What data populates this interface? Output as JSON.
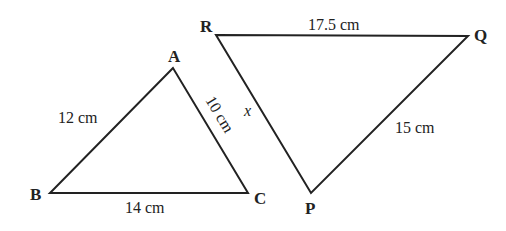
{
  "triangles": [
    {
      "name": "ABC",
      "vertices": {
        "A": "A",
        "B": "B",
        "C": "C"
      },
      "sides": {
        "AB": "12 cm",
        "BC": "14 cm",
        "AC": "10 cm"
      }
    },
    {
      "name": "PQR",
      "vertices": {
        "P": "P",
        "Q": "Q",
        "R": "R"
      },
      "sides": {
        "RQ": "17.5 cm",
        "PQ": "15 cm",
        "RP": "x"
      }
    }
  ]
}
